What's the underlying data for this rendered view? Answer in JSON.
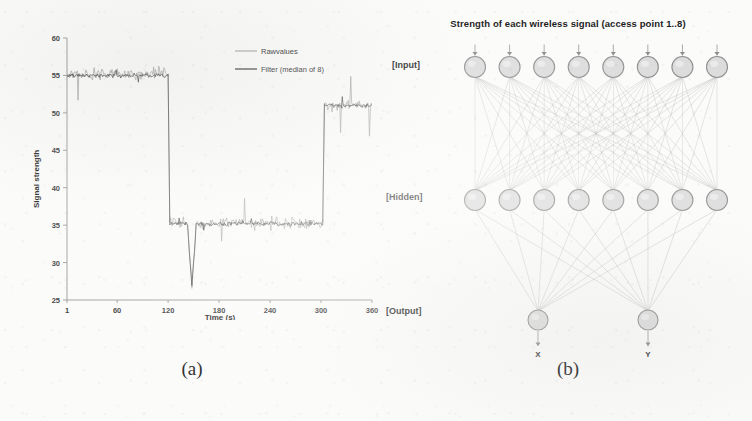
{
  "figure": {
    "panel_a_caption": "(a)",
    "panel_b_caption": "(b)"
  },
  "chart_data": {
    "type": "line",
    "title": "",
    "xlabel": "Time (s)",
    "ylabel": "Signal strength",
    "xlim": [
      1,
      360
    ],
    "ylim": [
      25,
      60
    ],
    "xticks": [
      1,
      60,
      120,
      180,
      240,
      300,
      360
    ],
    "yticks": [
      25,
      30,
      35,
      40,
      45,
      50,
      55,
      60
    ],
    "grid": false,
    "legend_position": "top-right",
    "legend": [
      "Rawvalues",
      "Filter (median of 8)"
    ],
    "series": [
      {
        "name": "Rawvalues",
        "color": "#9a9a9a",
        "description": "Noisy raw RSSI samples; plateau ~55 until t=120, ~35 until t=302, then ~51",
        "segments": [
          {
            "t_start": 1,
            "t_end": 120,
            "level": 55.2,
            "noise": 1.4
          },
          {
            "t_start": 122,
            "t_end": 302,
            "level": 35.3,
            "noise": 1.5
          },
          {
            "t_start": 304,
            "t_end": 360,
            "level": 51.0,
            "noise": 1.3
          }
        ]
      },
      {
        "name": "Filter (median of 8)",
        "color": "#3d3d3d",
        "description": "Median-of-8 filtered signal following the same three plateaus with reduced noise",
        "segments": [
          {
            "t_start": 1,
            "t_end": 120,
            "level": 55.0,
            "noise": 0.5
          },
          {
            "t_start": 122,
            "t_end": 302,
            "level": 35.2,
            "noise": 0.5
          },
          {
            "t_start": 304,
            "t_end": 360,
            "level": 51.0,
            "noise": 0.5
          }
        ]
      }
    ],
    "annotations": [
      {
        "text": "deep dip",
        "t": 148,
        "value": 27.0
      },
      {
        "text": "step down",
        "t": 121,
        "value": 45.0
      },
      {
        "text": "step up",
        "t": 303,
        "value": 43.0
      }
    ]
  },
  "network": {
    "title": "Strength of each wireless signal (access point 1..8)",
    "layers": [
      {
        "name": "input",
        "label": "[Input]",
        "node_count": 8
      },
      {
        "name": "hidden",
        "label": "[Hidden]",
        "node_count": 8
      },
      {
        "name": "output",
        "label": "[Output]",
        "node_count": 2
      }
    ],
    "output_labels": [
      "X",
      "Y"
    ],
    "node_fill": "#dcdcdc",
    "node_stroke": "#8f8f8f",
    "edge_color": "#b4b4b4"
  }
}
